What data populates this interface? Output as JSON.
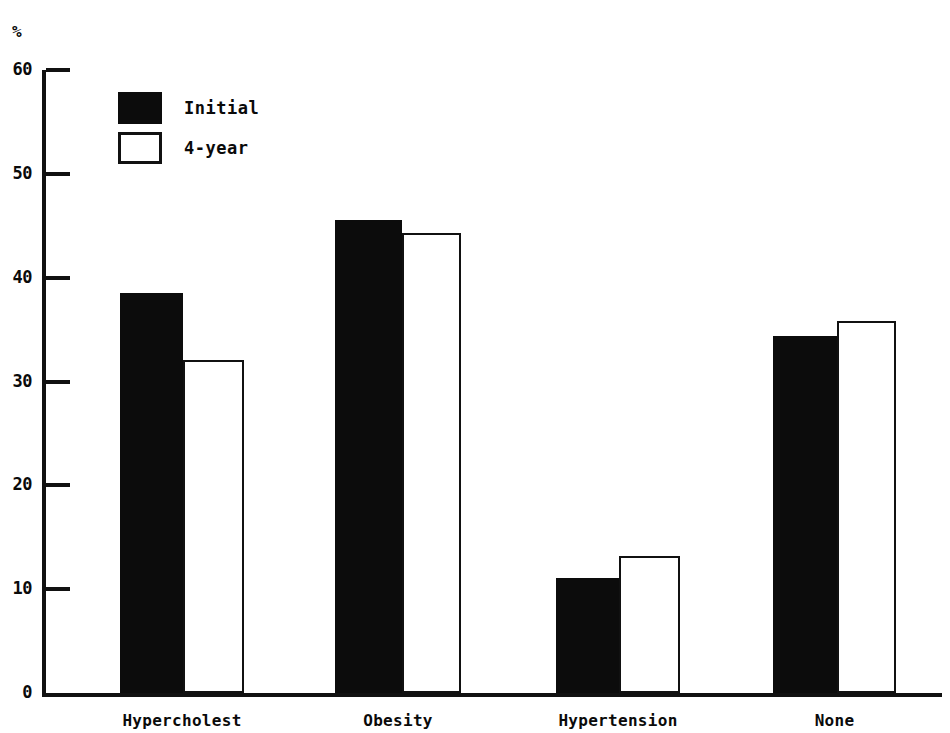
{
  "chart_data": {
    "type": "bar",
    "title": "",
    "subtitle": "",
    "xlabel": "",
    "ylabel": "%",
    "ylim": [
      0,
      60
    ],
    "yticks": [
      0,
      10,
      20,
      30,
      40,
      50,
      60
    ],
    "ytick_labels": [
      "0",
      "10",
      "20",
      "30",
      "40",
      "50",
      "60"
    ],
    "grid": false,
    "legend_position": "upper-left",
    "categories": [
      "Hypercholest",
      "Obesity",
      "Hypertension",
      "None"
    ],
    "series": [
      {
        "name": "Initial",
        "color": "#0c0c0c",
        "style": "filled",
        "values": [
          38.5,
          45.6,
          11.1,
          34.4
        ]
      },
      {
        "name": "4-year",
        "color": "#ffffff",
        "style": "hollow",
        "values": [
          32.1,
          44.3,
          13.2,
          35.8
        ]
      }
    ]
  },
  "axis": {
    "unit_symbol": "%"
  },
  "legend": {
    "entries": [
      {
        "label": "Initial",
        "swatch": "filled-square-icon"
      },
      {
        "label": "4-year",
        "swatch": "hollow-square-icon"
      }
    ]
  }
}
